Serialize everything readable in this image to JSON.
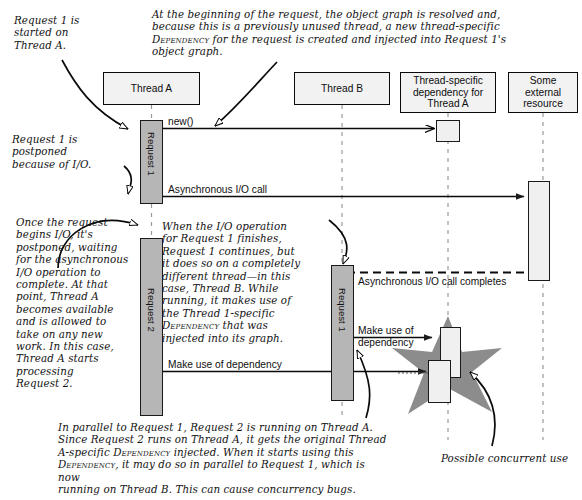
{
  "diagram": {
    "lifelines": [
      {
        "id": "thread-a",
        "label": "Thread A"
      },
      {
        "id": "thread-b",
        "label": "Thread B"
      },
      {
        "id": "thread-specific-dependency",
        "label": "Thread-specific dependency for Thread A"
      },
      {
        "id": "external-resource",
        "label": "Some external resource"
      }
    ],
    "activations": [
      {
        "id": "request-1-thread-a",
        "label": "Request 1"
      },
      {
        "id": "request-2-thread-a",
        "label": "Request 2"
      },
      {
        "id": "request-1-thread-b",
        "label": "Request 1"
      }
    ],
    "messages": [
      {
        "id": "new-call",
        "label": "new()"
      },
      {
        "id": "async-io-call",
        "label": "Asynchronous I/O call"
      },
      {
        "id": "async-io-complete",
        "label": "Asynchronous I/O call completes"
      },
      {
        "id": "make-use-b",
        "label": "Make use of\ndependency"
      },
      {
        "id": "make-use-a",
        "label": "Make use of dependency"
      }
    ],
    "notes": {
      "request1_started": "Request 1 is\nstarted on\nThread A.",
      "object_graph": "At the beginning of the request, the object graph is resolved and,\nbecause this is a previously unused thread, a new thread-specific\nDEPENDENCY for the request is created and injected into Request 1's\nobject graph.",
      "request1_postponed": "Request 1 is\npostponed\nbecause of I/O.",
      "thread_a_available": "Once the request\nbegins I/O, it's\npostponed, waiting\nfor the asynchronous\nI/O operation to\ncomplete. At that\npoint, Thread A\nbecomes available\nand is allowed to\ntake on any new\nwork. In this case,\nThread A starts\nprocessing\nRequest 2.",
      "continues_on_thread_b": "When the I/O operation\nfor Request 1 finishes,\nRequest 1 continues, but\nit does so on a completely\ndifferent thread—in this\ncase, Thread B. While\nrunning, it makes use of\nthe Thread 1-specific\nDEPENDENCY that was\ninjected into its graph.",
      "concurrency_bugs": "In parallel to Request 1, Request 2 is running on Thread A.\nSince Request 2 runs on Thread A, it gets the original Thread\nA-specific DEPENDENCY injected. When it starts using this\nDEPENDENCY, it may do so in parallel to Request 1, which is now\nrunning on Thread B. This can cause concurrency bugs.",
      "possible_concurrent_use": "Possible concurrent use"
    },
    "colors": {
      "ink": "#0a0a0a",
      "box_fill": "#f2f2f2",
      "activation_gray": "#b6b6b6",
      "activation_light": "#f0f0f0",
      "star_fill": "#8c8c8c",
      "lifeline": "#9a9a9a"
    }
  }
}
